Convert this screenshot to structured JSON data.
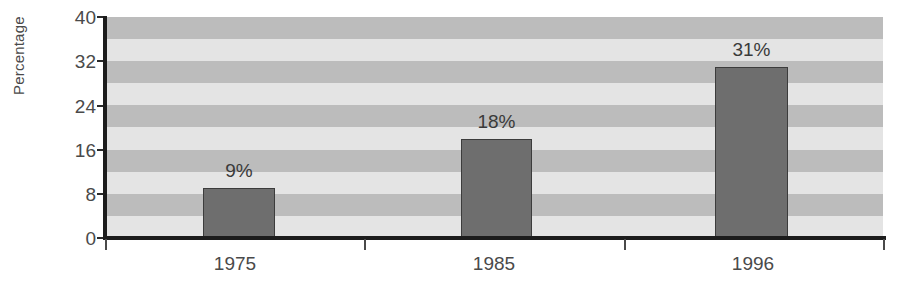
{
  "chart_data": {
    "type": "bar",
    "title": "",
    "subtitle": "",
    "xlabel": "",
    "ylabel": "Percentage",
    "categories": [
      "1975",
      "1985",
      "1996"
    ],
    "values": [
      9,
      18,
      31
    ],
    "value_labels": [
      "9%",
      "18%",
      "31%"
    ],
    "series": [
      {
        "name": "Percentage",
        "values": [
          9,
          18,
          31
        ]
      }
    ],
    "ylim": [
      0,
      40
    ],
    "y_ticks": [
      0,
      8,
      16,
      24,
      32,
      40
    ],
    "y_tick_labels": [
      "0",
      "8",
      "16",
      "24",
      "32",
      "40"
    ],
    "y_tick_interval": 8,
    "grid": false,
    "banding": {
      "enabled": true,
      "interval": 4,
      "dark_ranges": [
        [
          4,
          8
        ],
        [
          12,
          16
        ],
        [
          20,
          24
        ],
        [
          28,
          32
        ],
        [
          36,
          40
        ]
      ],
      "light_ranges": [
        [
          0,
          4
        ],
        [
          8,
          12
        ],
        [
          16,
          20
        ],
        [
          24,
          28
        ],
        [
          32,
          36
        ]
      ]
    },
    "legend": {
      "visible": false,
      "position": "none",
      "entries": []
    },
    "annotations": []
  },
  "colors": {
    "bar_fill": "#6e6e6e",
    "bar_outline": "#3c3c3c",
    "band_dark": "#bcbcbc",
    "band_light": "#e4e4e4",
    "axis_line": "#1c1c1c",
    "tick_mark": "#4a4a4a",
    "text": "#4a4a4a",
    "background": "#ffffff"
  },
  "axes": {
    "y_title": "Percentage",
    "y_labels": [
      "40",
      "32",
      "24",
      "16",
      "8",
      "0"
    ],
    "x_labels": [
      "1975",
      "1985",
      "1996"
    ]
  }
}
